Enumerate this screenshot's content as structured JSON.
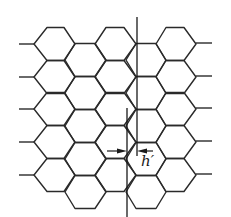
{
  "diagram": {
    "title": "",
    "colors": {
      "stroke": "#2a2a2a",
      "background": "#ffffff"
    },
    "lattice": {
      "even_columns": [
        {
          "left": 34,
          "right": 75,
          "top_left": 47,
          "top_right": 64
        },
        {
          "left": 95,
          "right": 136,
          "top_left": 106,
          "top_right": 124
        },
        {
          "left": 156,
          "right": 196,
          "top_left": 166,
          "top_right": 184
        }
      ],
      "even_row_centers": [
        44,
        77,
        109,
        142,
        175
      ],
      "odd_columns": [
        {
          "left": 65,
          "right": 106,
          "top_left": 75,
          "top_right": 95
        },
        {
          "left": 126,
          "right": 166,
          "top_left": 136,
          "top_right": 156
        }
      ],
      "odd_row_centers": [
        60,
        93,
        126,
        159,
        192
      ],
      "half_height": 16.5,
      "left_stubs": {
        "x1": 19,
        "x2": 34
      },
      "right_stubs": {
        "x1": 196,
        "x2": 212
      }
    },
    "lines": [
      {
        "name": "right-vertical-line",
        "x": 137,
        "y1": 17,
        "y2": 156
      },
      {
        "name": "left-vertical-line",
        "x": 127,
        "y1": 108,
        "y2": 217
      }
    ],
    "dimension": {
      "label": "h′",
      "left_arrow": {
        "x1": 107,
        "x2": 127,
        "y": 151
      },
      "right_arrow": {
        "x1": 153,
        "x2": 137,
        "y": 151
      },
      "label_pos": {
        "x": 141,
        "y": 154
      }
    }
  }
}
